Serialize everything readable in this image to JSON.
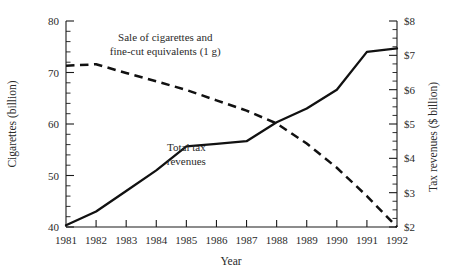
{
  "chart_data": {
    "type": "line",
    "title": "",
    "subtitle": "",
    "xlabel": "Year",
    "ylabel": "Cigarettes (billion)",
    "y2label": "Tax revenues ($ billion)",
    "x": [
      1981,
      1982,
      1983,
      1984,
      1985,
      1986,
      1987,
      1988,
      1989,
      1990,
      1991,
      1992
    ],
    "xticklabels": [
      "1981",
      "1982",
      "1983",
      "1984",
      "1985",
      "1986",
      "1987",
      "1988",
      "1989",
      "1990",
      "1991",
      "1992"
    ],
    "xlim": [
      1981,
      1992
    ],
    "ylim": [
      40,
      80
    ],
    "yticks": [
      40,
      50,
      60,
      70,
      80
    ],
    "yticklabels": [
      "40",
      "50",
      "60",
      "70",
      "80"
    ],
    "y_minor_step": 2,
    "y2lim": [
      2,
      8
    ],
    "y2ticks": [
      2,
      3,
      4,
      5,
      6,
      7,
      8
    ],
    "y2ticklabels": [
      "$2",
      "$3",
      "$4",
      "$5",
      "$6",
      "$7",
      "$8"
    ],
    "y2_minor_step": 0.25,
    "grid": false,
    "legend": "annotations-inline",
    "series": [
      {
        "name": "Sale of cigarettes and fine-cut equivalents (1 g)",
        "axis": "left",
        "style": "dashed",
        "unit": "billion cigarettes",
        "values": [
          71.3,
          71.6,
          69.9,
          68.3,
          66.6,
          64.6,
          62.6,
          60.1,
          56.2,
          51.5,
          46.0,
          40.0
        ]
      },
      {
        "name": "Total tax revenues",
        "axis": "right",
        "style": "solid",
        "unit": "$ billion",
        "values": [
          2.05,
          2.45,
          3.05,
          3.65,
          4.35,
          4.42,
          4.5,
          5.05,
          5.45,
          6.0,
          7.1,
          7.2
        ]
      }
    ],
    "annotations": [
      {
        "name": "cigarettes-series-label",
        "lines": [
          "Sale of cigarettes and",
          "fine-cut equivalents (1 g)"
        ],
        "x": 1984.3,
        "y": 76.2
      },
      {
        "name": "tax-revenues-series-label",
        "lines": [
          "Total tax",
          "revenues"
        ],
        "x": 1985.0,
        "y": 54.8
      }
    ]
  },
  "axes": {
    "left": {
      "title": "Cigarettes (billion)",
      "ticks": [
        "40",
        "50",
        "60",
        "70",
        "80"
      ]
    },
    "right": {
      "title": "Tax revenues ($ billion)",
      "ticks": [
        "$2",
        "$3",
        "$4",
        "$5",
        "$6",
        "$7",
        "$8"
      ]
    },
    "bottom": {
      "title": "Year",
      "ticks": [
        "1981",
        "1982",
        "1983",
        "1984",
        "1985",
        "1986",
        "1987",
        "1988",
        "1989",
        "1990",
        "1991",
        "1992"
      ]
    }
  },
  "annotation_text": {
    "cigarettes_line1": "Sale of cigarettes and",
    "cigarettes_line2": "fine-cut equivalents (1 g)",
    "tax_line1": "Total tax",
    "tax_line2": "revenues"
  },
  "colors": {
    "ink": "#111111",
    "text": "#2a2a2a",
    "background": "#ffffff"
  }
}
